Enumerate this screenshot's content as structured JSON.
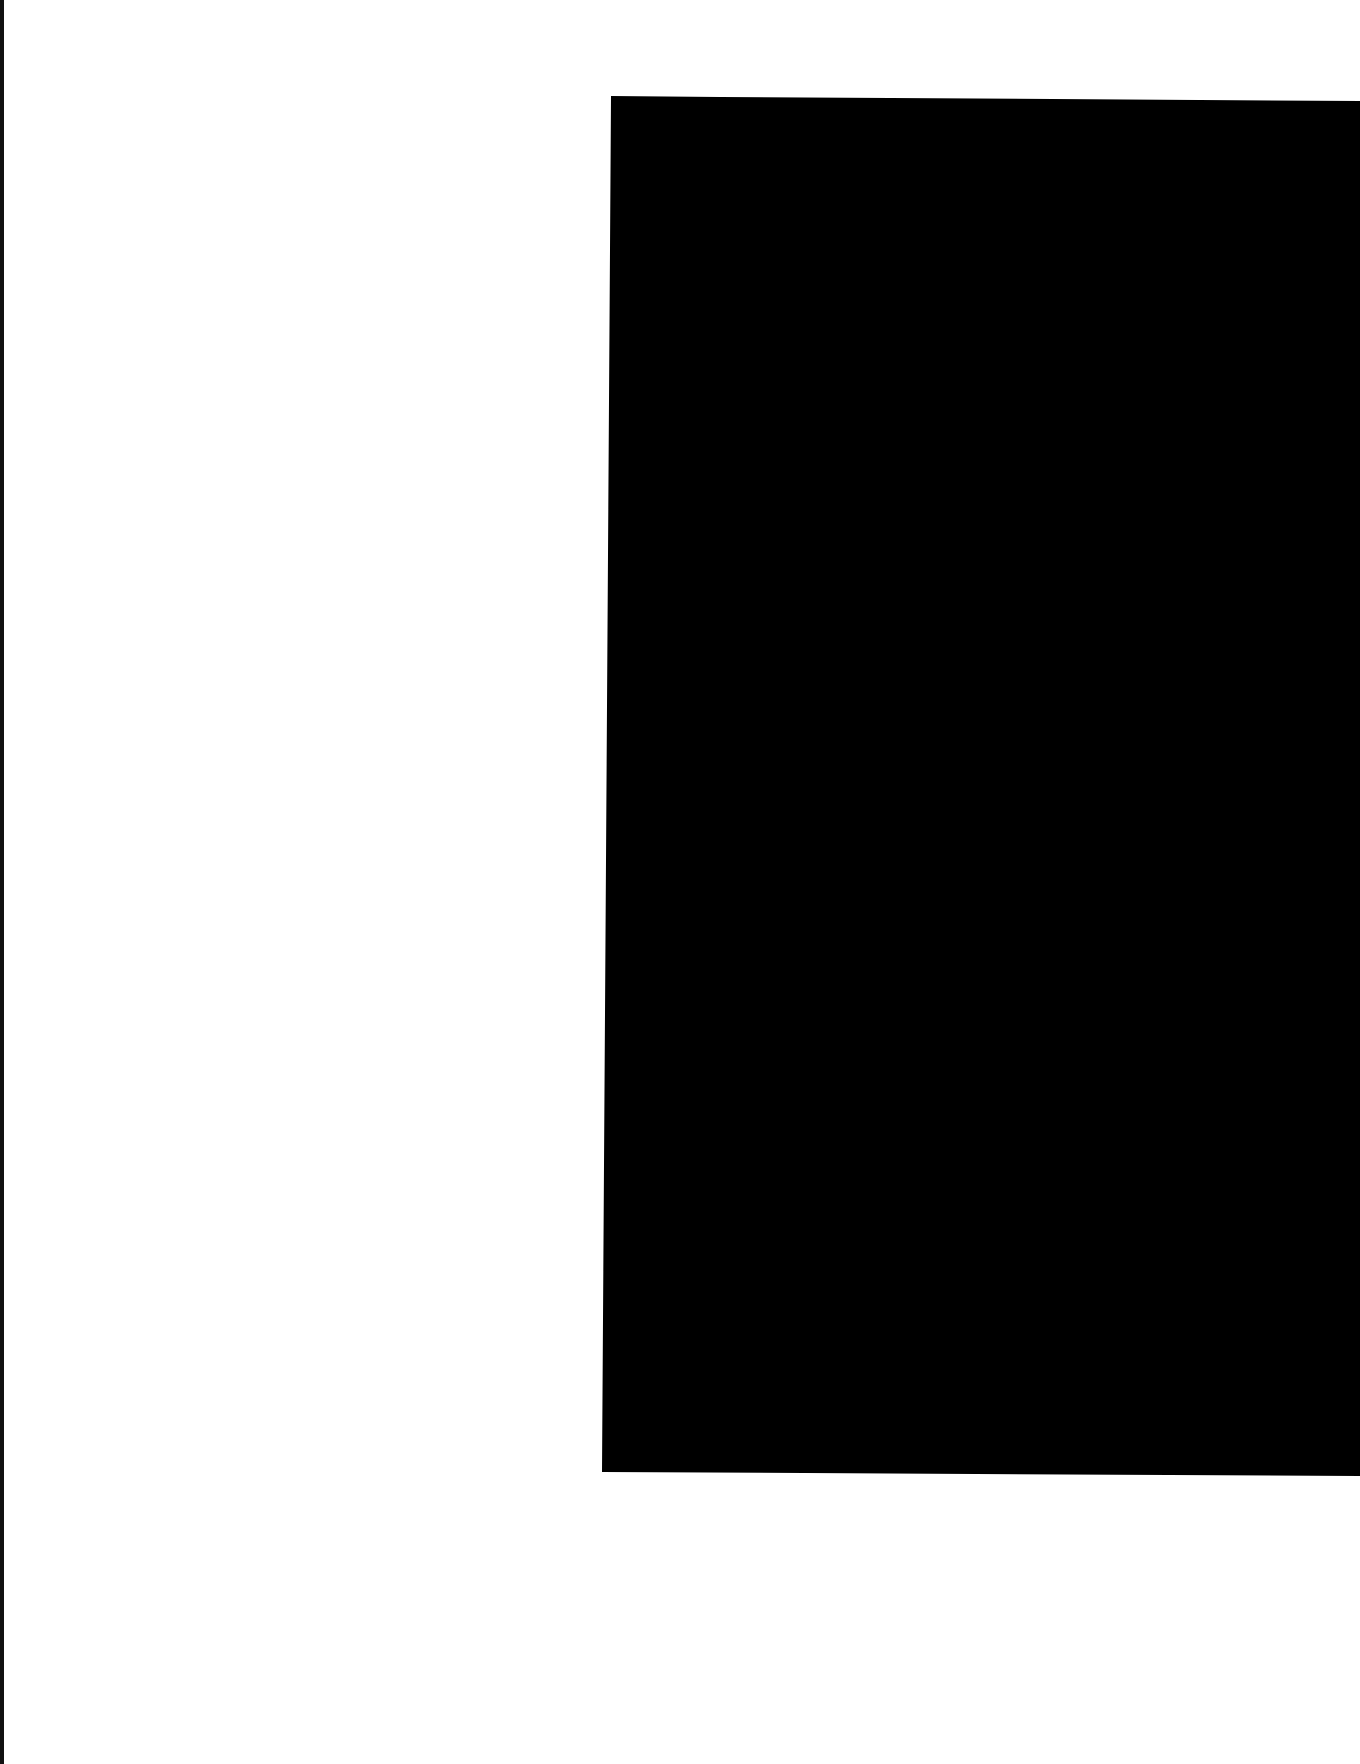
{
  "document": {
    "type": "scanned-page",
    "background_color": "#ffffff",
    "scan_edge_color": "#111111",
    "redaction": {
      "color": "#000000",
      "description": "large black redaction block covering right portion of page",
      "polygon": [
        [
          611,
          96
        ],
        [
          720,
          97
        ],
        [
          1360,
          101
        ],
        [
          1360,
          1476
        ],
        [
          602,
          1472
        ]
      ]
    },
    "text": []
  }
}
